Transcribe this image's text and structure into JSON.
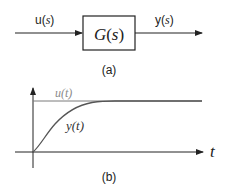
{
  "block_diagram": {
    "input_label": {
      "prefix": "u(",
      "var": "s",
      "suffix": ")"
    },
    "block_label": {
      "name": "G",
      "open": "(",
      "var": "s",
      "close": ")"
    },
    "output_label": {
      "prefix": "y(",
      "var": "s",
      "suffix": ")"
    },
    "caption": "(a)"
  },
  "step_response": {
    "input_signal_label": "u(t)",
    "output_signal_label": "y(t)",
    "time_axis_label": "t",
    "caption": "(b)",
    "colors": {
      "input_signal": "#7a7a7a",
      "output_signal": "#555555",
      "axes": "#222222"
    }
  }
}
